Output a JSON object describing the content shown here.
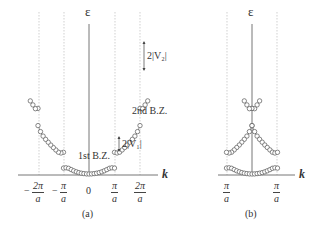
{
  "figure": {
    "background": "#ffffff",
    "line_color": "#555555",
    "dash_color": "#aaaaaa",
    "point_color": "#555555"
  },
  "panel_a": {
    "caption": "(a)",
    "y_axis_label": "ε",
    "x_axis_label": "k",
    "ticks": [
      {
        "sign": "−",
        "num": "2π",
        "den": "a"
      },
      {
        "sign": "−",
        "num": "π",
        "den": "a"
      },
      {
        "sign": "",
        "num": "0",
        "den": ""
      },
      {
        "sign": "",
        "num": "π",
        "den": "a"
      },
      {
        "sign": "",
        "num": "2π",
        "den": "a"
      }
    ],
    "annotations": {
      "first_bz": "1st B.Z.",
      "second_bz": "2nd B.Z.",
      "gap1": "2|V₁|",
      "gap2": "2|V₂|"
    }
  },
  "panel_b": {
    "caption": "(b)",
    "y_axis_label": "ε",
    "x_axis_label": "k",
    "ticks": [
      {
        "sign": "",
        "num": "π",
        "den": "a"
      },
      {
        "sign": "",
        "num": "π",
        "den": "a"
      }
    ]
  }
}
